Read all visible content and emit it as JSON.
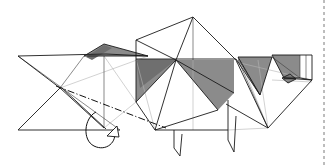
{
  "document": {
    "kind": "origami-folding-diagram",
    "title": "",
    "caption": "",
    "background_color": "#ffffff"
  },
  "page": {
    "width": 330,
    "height": 167,
    "margin_rule": {
      "name": "right-margin-dashed-rule",
      "orientation": "vertical",
      "x": 324,
      "y_start": 0,
      "y_end": 167,
      "color": "#7a7a7a",
      "style": "dashed"
    }
  },
  "palette": {
    "paper_front": "#ffffff",
    "paper_back_mid": "#8b8b8b",
    "paper_back_dark": "#6f6f6f",
    "edge_strong": "#1a1a1a",
    "edge_thin": "#3a3a3a",
    "edge_faint": "#b4b4b4"
  },
  "figure": {
    "name": "folded-quadruped-model",
    "parts": [
      {
        "name": "tail-flap",
        "region": "left"
      },
      {
        "name": "hind-quarters-panel",
        "region": "left-center"
      },
      {
        "name": "body-panel",
        "region": "center"
      },
      {
        "name": "shoulder-panel",
        "region": "right-center"
      },
      {
        "name": "head-and-muzzle",
        "region": "right"
      },
      {
        "name": "front-leg",
        "region": "bottom-center"
      },
      {
        "name": "rear-leg",
        "region": "bottom-center-left"
      }
    ]
  },
  "shaded_facets": [
    {
      "name": "facet-tail-wedge",
      "tone": "mid",
      "points": "84,56 104,44 148,56 110,56"
    },
    {
      "name": "facet-tail-sliver",
      "tone": "dark",
      "points": "86,57 104,45 112,48 92,60"
    },
    {
      "name": "facet-body-upper-left",
      "tone": "mid",
      "points": "136,59 176,59 176,60 136,60"
    },
    {
      "name": "facet-body-left-fan",
      "tone": "mid",
      "points": "136,59 176,60 136,102"
    },
    {
      "name": "facet-body-left-fan-dark",
      "tone": "dark",
      "points": "136,59 176,60 140,88"
    },
    {
      "name": "facet-body-right-band",
      "tone": "mid",
      "points": "176,60 234,60 234,93 218,110 176,60"
    },
    {
      "name": "facet-shoulder-wedge",
      "tone": "mid",
      "points": "238,57 272,57 260,95 238,60"
    },
    {
      "name": "facet-head-block",
      "tone": "mid",
      "points": "272,55 300,55 300,78 284,78"
    },
    {
      "name": "facet-muzzle-dot",
      "tone": "dark",
      "points": "282,78 290,74 296,79 288,83"
    }
  ],
  "strong_edges": [
    {
      "name": "edge-tail-top",
      "d": "M18,56 L106,54 L148,56"
    },
    {
      "name": "edge-tail-x-upper",
      "d": "M18,56 L60,88"
    },
    {
      "name": "edge-tail-x-lower",
      "d": "M18,130 L60,88"
    },
    {
      "name": "edge-tail-bottom",
      "d": "M18,130 L120,130"
    },
    {
      "name": "edge-tail-wedge-outline",
      "d": "M84,56 L104,44 L148,56 Z"
    },
    {
      "name": "edge-tail-crease-double-a",
      "d": "M60,88 L104,128"
    },
    {
      "name": "edge-tail-crease-double-b",
      "d": "M62,88 L106,129"
    },
    {
      "name": "edge-body-left-vert",
      "d": "M136,40 L136,102"
    },
    {
      "name": "edge-body-top-ridge",
      "d": "M136,40 L193,17 L236,60"
    },
    {
      "name": "edge-body-top-left",
      "d": "M136,40 L176,60"
    },
    {
      "name": "edge-body-apex-left",
      "d": "M193,17 L176,60"
    },
    {
      "name": "edge-body-horizon",
      "d": "M136,59 L236,59"
    },
    {
      "name": "edge-body-fan-1",
      "d": "M176,60 L136,102"
    },
    {
      "name": "edge-body-fan-2",
      "d": "M176,60 L155,130"
    },
    {
      "name": "edge-body-fan-3",
      "d": "M176,60 L218,110"
    },
    {
      "name": "edge-body-fan-4",
      "d": "M176,60 L234,93"
    },
    {
      "name": "edge-body-lower-left",
      "d": "M136,102 L155,130"
    },
    {
      "name": "edge-body-lower-base",
      "d": "M155,130 L218,110"
    },
    {
      "name": "edge-shoulder-left",
      "d": "M236,59 L260,95"
    },
    {
      "name": "edge-shoulder-wedge",
      "d": "M238,57 L272,57 L260,95 Z"
    },
    {
      "name": "edge-head-outline",
      "d": "M272,55 L312,55 L312,80 L300,78 L284,78 Z"
    },
    {
      "name": "edge-head-chin",
      "d": "M284,78 L312,80"
    },
    {
      "name": "edge-neck-right",
      "d": "M312,80 L268,128"
    },
    {
      "name": "edge-neck-left",
      "d": "M236,60 L268,128"
    },
    {
      "name": "edge-leg-front",
      "d": "M228,100 L228,140 L234,152 L236,116"
    },
    {
      "name": "edge-leg-rear",
      "d": "M174,130 L174,148 L180,156 L182,134"
    },
    {
      "name": "edge-belly",
      "d": "M155,130 L228,130"
    },
    {
      "name": "edge-hind-panel-right",
      "d": "M226,104 L268,128"
    },
    {
      "name": "edge-muzzle-loop",
      "d": "M282,78 L290,74 L296,79 L288,83 Z"
    }
  ],
  "thin_edges": [
    {
      "name": "crease-tail-diag-1",
      "d": "M18,56 L120,130"
    },
    {
      "name": "crease-tail-diag-2",
      "d": "M84,56 L60,88"
    },
    {
      "name": "crease-tail-right",
      "d": "M104,56 L104,128"
    },
    {
      "name": "crease-body-center",
      "d": "M193,17 L193,60"
    },
    {
      "name": "crease-neck-cross-1",
      "d": "M238,60 L268,128"
    },
    {
      "name": "crease-neck-cross-2",
      "d": "M260,95 L240,62"
    },
    {
      "name": "crease-head-grid-1",
      "d": "M300,55 L300,78"
    },
    {
      "name": "crease-head-grid-2",
      "d": "M272,57 L300,78"
    },
    {
      "name": "crease-head-grid-3",
      "d": "M306,55 L306,79"
    }
  ],
  "faint_edges": [
    {
      "name": "ghost-tail-fan-1",
      "d": "M60,88 L148,56"
    },
    {
      "name": "ghost-tail-fan-2",
      "d": "M104,56 L136,102"
    },
    {
      "name": "ghost-body-left",
      "d": "M136,59 L155,130"
    },
    {
      "name": "ghost-body-vert",
      "d": "M193,60 L193,130"
    },
    {
      "name": "ghost-neck-1",
      "d": "M236,62 L312,80"
    },
    {
      "name": "ghost-neck-2",
      "d": "M242,64 L268,128"
    },
    {
      "name": "ghost-neck-3",
      "d": "M258,60 L268,128"
    },
    {
      "name": "ghost-head-base",
      "d": "M272,80 L312,82"
    },
    {
      "name": "ghost-leg",
      "d": "M228,130 L268,128"
    },
    {
      "name": "ghost-tail-lower",
      "d": "M104,128 L136,102"
    }
  ],
  "annotations": {
    "fold_line": {
      "name": "valley-fold-chain-line",
      "style": "dash-dot",
      "d": "M56,86 L166,128"
    },
    "fold_arrow": {
      "name": "fold-over-curl-arrow",
      "style": "curved-loop-with-hollow-head",
      "curl_d": "M96,112 C84,118 82,140 94,146 C106,152 118,142 114,130",
      "head_points": "117,126 107,136 119,137"
    }
  }
}
